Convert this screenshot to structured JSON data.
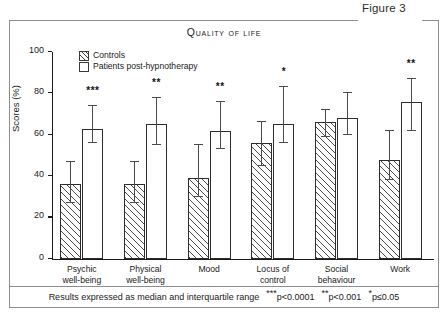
{
  "figure": {
    "label": "Figure 3",
    "title": "Quality of life"
  },
  "legend": {
    "items": [
      {
        "label": "Controls",
        "style": "hatched"
      },
      {
        "label": "Patients post-hypnotherapy",
        "style": "open"
      }
    ]
  },
  "footer": {
    "text": "Results expressed as median and interquartile range",
    "sig_parts": [
      {
        "stars": "***",
        "text": "p<0.0001"
      },
      {
        "stars": "**",
        "text": "p<0.001"
      },
      {
        "stars": "*",
        "text": "p≤0.05"
      }
    ]
  },
  "axis": {
    "y_label": "Scores (%)",
    "y_ticks": [
      0,
      20,
      40,
      60,
      80,
      100
    ],
    "y_min": 0,
    "y_max": 100
  },
  "chart_data": {
    "type": "bar",
    "title": "Quality of life",
    "xlabel": "",
    "ylabel": "Scores (%)",
    "ylim": [
      0,
      100
    ],
    "grid": false,
    "legend_position": "top-left",
    "error_type": "interquartile range",
    "categories": [
      "Psychic well-being",
      "Physical well-being",
      "Mood",
      "Locus of control",
      "Social behaviour",
      "Work"
    ],
    "category_lines": [
      [
        "Psychic",
        "well-being"
      ],
      [
        "Physical",
        "well-being"
      ],
      [
        "Mood",
        ""
      ],
      [
        "Locus of",
        "control"
      ],
      [
        "Social",
        "behaviour"
      ],
      [
        "Work",
        ""
      ]
    ],
    "series": [
      {
        "name": "Controls",
        "values": [
          36,
          36,
          39,
          56,
          66,
          48
        ],
        "err_low": [
          27,
          27,
          30,
          45,
          59,
          38
        ],
        "err_high": [
          47,
          47,
          55,
          66,
          72,
          62
        ]
      },
      {
        "name": "Patients post-hypnotherapy",
        "values": [
          63,
          65,
          62,
          65,
          68,
          76
        ],
        "err_low": [
          56,
          55,
          53,
          56,
          60,
          62
        ],
        "err_high": [
          74,
          78,
          76,
          83,
          80,
          87
        ]
      }
    ],
    "significance": [
      "***",
      "**",
      "**",
      "*",
      "",
      "**"
    ]
  }
}
